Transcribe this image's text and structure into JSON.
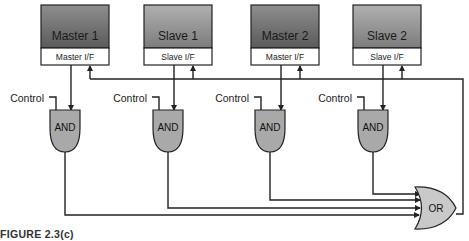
{
  "diagram": {
    "units": [
      {
        "name": "Master 1",
        "interface": "Master I/F",
        "type": "master"
      },
      {
        "name": "Slave 1",
        "interface": "Slave I/F",
        "type": "slave"
      },
      {
        "name": "Master 2",
        "interface": "Master I/F",
        "type": "master"
      },
      {
        "name": "Slave 2",
        "interface": "Slave I/F",
        "type": "slave"
      }
    ],
    "and_gates": [
      {
        "label": "AND",
        "control_label": "Control"
      },
      {
        "label": "AND",
        "control_label": "Control"
      },
      {
        "label": "AND",
        "control_label": "Control"
      },
      {
        "label": "AND",
        "control_label": "Control"
      }
    ],
    "or_gate": {
      "label": "OR"
    },
    "caption": "FIGURE 2.3(c)",
    "colors": {
      "master_fill_top": "#8a8a8a",
      "master_fill_bottom": "#5c5c5c",
      "slave_fill_top": "#a8a8a8",
      "slave_fill_bottom": "#7a7a7a",
      "gate_fill": "#a9a9a9",
      "or_fill": "#c9c9c9",
      "line": "#222222"
    }
  }
}
